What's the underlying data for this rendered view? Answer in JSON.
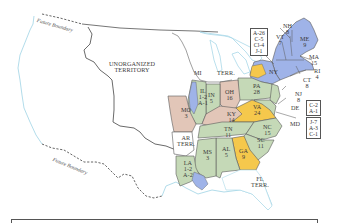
{
  "map": {
    "title_region_labels": {
      "unorganized": [
        "UNORGANIZED",
        "TERRITORY"
      ],
      "mi_terr": [
        "MI",
        "TERR."
      ],
      "ar_terr": [
        "AR",
        "TERR."
      ],
      "fl_terr": [
        "FL",
        "TERR."
      ],
      "future_boundary_north": "Future Boundary",
      "future_boundary_south": "Future Boundary"
    },
    "states": [
      {
        "id": "ME",
        "name": "ME",
        "value": "9",
        "color": "#9fb3e8"
      },
      {
        "id": "NH",
        "name": "NH",
        "value": "8",
        "color": "#9fb3e8"
      },
      {
        "id": "VT",
        "name": "VT",
        "value": "7",
        "color": "#9fb3e8"
      },
      {
        "id": "MA",
        "name": "MA",
        "value": "15",
        "color": "#9fb3e8"
      },
      {
        "id": "RI",
        "name": "RI",
        "value": "4",
        "color": "#9fb3e8"
      },
      {
        "id": "CT",
        "name": "CT",
        "value": "8",
        "color": "#9fb3e8"
      },
      {
        "id": "NY",
        "name": "NY",
        "value": "",
        "color": "#f5c84c"
      },
      {
        "id": "NJ",
        "name": "NJ",
        "value": "8",
        "color": "#c5d9b7"
      },
      {
        "id": "DE",
        "name": "DE",
        "value": "",
        "color": "#c5d9b7"
      },
      {
        "id": "MD",
        "name": "MD",
        "value": "",
        "color": "#c5d9b7"
      },
      {
        "id": "PA",
        "name": "PA",
        "value": "28",
        "color": "#c5d9b7"
      },
      {
        "id": "VA",
        "name": "VA",
        "value": "24",
        "color": "#f5c84c"
      },
      {
        "id": "NC",
        "name": "NC",
        "value": "15",
        "color": "#c5d9b7"
      },
      {
        "id": "SC",
        "name": "SC",
        "value": "11",
        "color": "#c5d9b7"
      },
      {
        "id": "GA",
        "name": "GA",
        "value": "9",
        "color": "#f5c84c"
      },
      {
        "id": "AL",
        "name": "AL",
        "value": "5",
        "color": "#c5d9b7"
      },
      {
        "id": "MS",
        "name": "MS",
        "value": "3",
        "color": "#c5d9b7"
      },
      {
        "id": "LA",
        "name": "LA",
        "value": "1-2 A-2",
        "color": "#c5d9b7"
      },
      {
        "id": "TN",
        "name": "TN",
        "value": "11",
        "color": "#c5d9b7"
      },
      {
        "id": "KY",
        "name": "KY",
        "value": "14",
        "color": "#e2c6b8"
      },
      {
        "id": "OH",
        "name": "OH",
        "value": "16",
        "color": "#e2c6b8"
      },
      {
        "id": "IN",
        "name": "IN",
        "value": "5",
        "color": "#c5d9b7"
      },
      {
        "id": "IL",
        "name": "IL",
        "value": "1-2 A-1",
        "color": "#c5d9b7"
      },
      {
        "id": "MO",
        "name": "MO",
        "value": "3",
        "color": "#e2c6b8"
      }
    ],
    "split_boxes": {
      "ny": [
        "A-26",
        "C-5",
        "Cl-4",
        "J-1"
      ],
      "de": [
        "C-2",
        "A-1"
      ],
      "md": [
        "J-7",
        "A-3",
        "C-1"
      ]
    },
    "colors": {
      "blue": "#9fb3e8",
      "yellow": "#f5c84c",
      "green": "#c5d9b7",
      "pink": "#e2c6b8",
      "water": "#bfe3ef",
      "border": "#5a5a5a"
    }
  }
}
